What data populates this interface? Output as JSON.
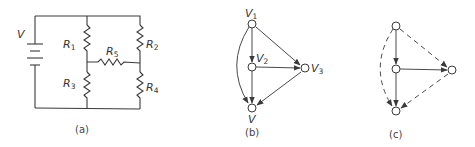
{
  "figure": {
    "panel_a": {
      "caption": "(a)",
      "source_label": "V",
      "resistors": [
        {
          "id": "R1",
          "letter": "R",
          "sub": "1"
        },
        {
          "id": "R2",
          "letter": "R",
          "sub": "2"
        },
        {
          "id": "R3",
          "letter": "R",
          "sub": "3"
        },
        {
          "id": "R4",
          "letter": "R",
          "sub": "4"
        },
        {
          "id": "R5",
          "letter": "R",
          "sub": "5"
        }
      ]
    },
    "panel_b": {
      "caption": "(b)",
      "nodes": [
        {
          "id": "V1",
          "letter": "V",
          "sub": "1"
        },
        {
          "id": "V2",
          "letter": "V",
          "sub": "2"
        },
        {
          "id": "V3",
          "letter": "V",
          "sub": "3"
        },
        {
          "id": "V",
          "letter": "V",
          "sub": ""
        }
      ],
      "edges": [
        {
          "from": "V1",
          "to": "V2",
          "style": "solid"
        },
        {
          "from": "V1",
          "to": "V3",
          "style": "solid"
        },
        {
          "from": "V1",
          "to": "V",
          "style": "solid-curved"
        },
        {
          "from": "V2",
          "to": "V3",
          "style": "solid"
        },
        {
          "from": "V2",
          "to": "V",
          "style": "solid"
        },
        {
          "from": "V3",
          "to": "V",
          "style": "solid"
        }
      ]
    },
    "panel_c": {
      "caption": "(c)",
      "edges": [
        {
          "from": "top",
          "to": "middle",
          "style": "solid"
        },
        {
          "from": "top",
          "to": "right",
          "style": "dashed"
        },
        {
          "from": "top",
          "to": "bottom",
          "style": "dashed-curved"
        },
        {
          "from": "middle",
          "to": "right",
          "style": "solid"
        },
        {
          "from": "middle",
          "to": "bottom",
          "style": "solid"
        },
        {
          "from": "right",
          "to": "bottom",
          "style": "dashed"
        }
      ]
    }
  }
}
